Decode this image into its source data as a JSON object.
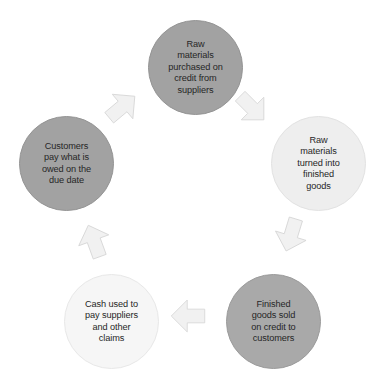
{
  "diagram": {
    "type": "cycle",
    "direction": "clockwise",
    "background_color": "#ffffff",
    "text_color": "#262626",
    "arrow_fill": "#f1f1f1",
    "arrow_stroke": "#d6d6d6",
    "nodes": [
      {
        "id": "raw-materials-purchased",
        "label": "Raw\nmaterials\npurchased on\ncredit from\nsuppliers",
        "position": "top",
        "fill": "#a2a2a2"
      },
      {
        "id": "raw-materials-turned",
        "label": "Raw\nmaterials\nturned into\nfinished\ngoods",
        "position": "right",
        "fill": "#eeeeee"
      },
      {
        "id": "finished-goods-sold",
        "label": "Finished\ngoods sold\non credit to\ncustomers",
        "position": "bottom-right",
        "fill": "#a9a9a9"
      },
      {
        "id": "cash-used-to-pay",
        "label": "Cash used to\npay suppliers\nand other\nclaims",
        "position": "bottom-left",
        "fill": "#f6f6f6"
      },
      {
        "id": "customers-pay",
        "label": "Customers\npay what is\nowed on the\ndue date",
        "position": "left",
        "fill": "#a2a2a2"
      }
    ],
    "arrows": [
      {
        "id": "arrow-top-to-right",
        "from": "raw-materials-purchased",
        "to": "raw-materials-turned",
        "rotation_deg": 135
      },
      {
        "id": "arrow-right-to-bottom-right",
        "from": "raw-materials-turned",
        "to": "finished-goods-sold",
        "rotation_deg": 197
      },
      {
        "id": "arrow-bottom-right-to-bottom-left",
        "from": "finished-goods-sold",
        "to": "cash-used-to-pay",
        "rotation_deg": 270
      },
      {
        "id": "arrow-bottom-left-to-left",
        "from": "cash-used-to-pay",
        "to": "customers-pay",
        "rotation_deg": 340
      },
      {
        "id": "arrow-left-to-top",
        "from": "customers-pay",
        "to": "raw-materials-purchased",
        "rotation_deg": 50
      }
    ]
  }
}
